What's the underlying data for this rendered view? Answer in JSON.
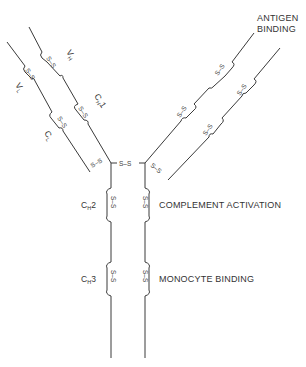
{
  "diagram": {
    "domain_labels": {
      "vh": "V",
      "vh_sub": "H",
      "vl": "V",
      "vl_sub": "L",
      "ch1": "C",
      "ch1_sub": "H",
      "ch1_num": "1",
      "cl": "C",
      "cl_sub": "L",
      "ch2": "C",
      "ch2_sub": "H",
      "ch2_num": "2",
      "ch3": "C",
      "ch3_sub": "H",
      "ch3_num": "3"
    },
    "function_labels": {
      "antigen_binding_line1": "ANTIGEN",
      "antigen_binding_line2": "BINDING",
      "complement_activation": "COMPLEMENT ACTIVATION",
      "monocyte_binding": "MONOCYTE BINDING"
    },
    "disulfide_label": "S–S",
    "colors": {
      "line": "#3a3a3a",
      "text": "#333333",
      "background": "#ffffff"
    }
  }
}
